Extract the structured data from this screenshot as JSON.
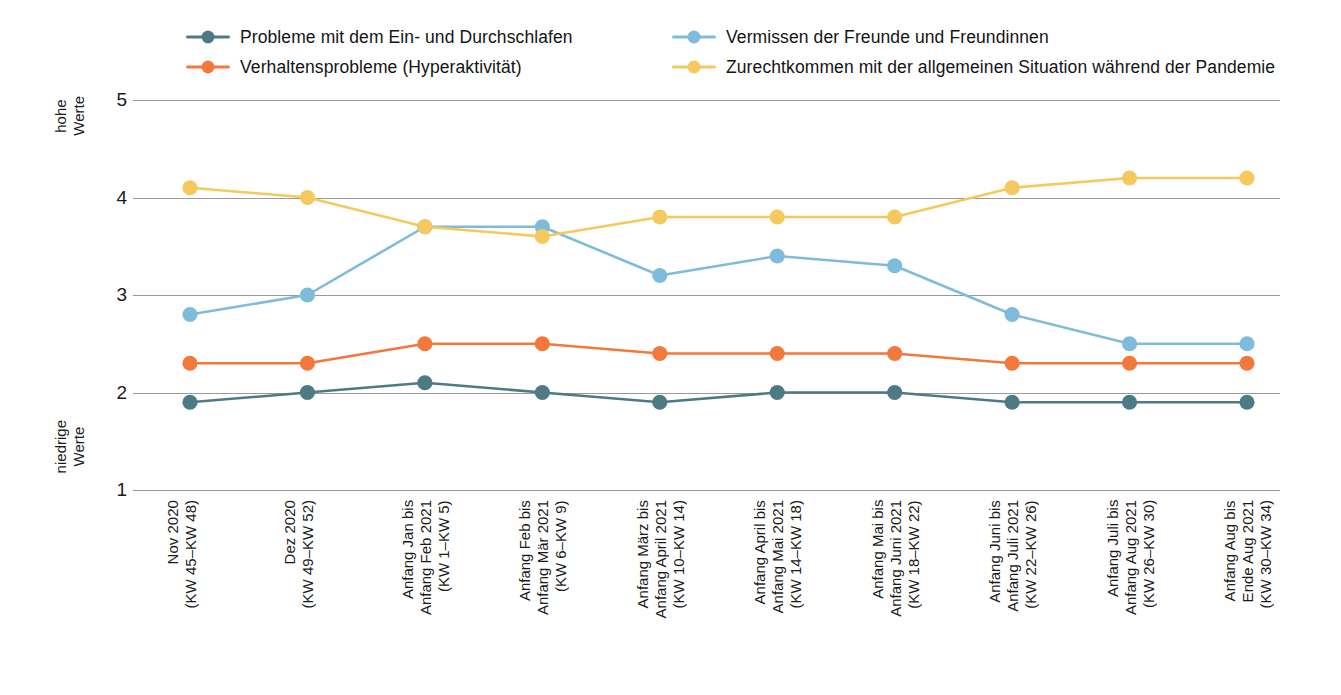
{
  "chart_data": {
    "type": "line",
    "title": "",
    "subtitle": "",
    "xlabel": "",
    "ylabel": "",
    "ylim": [
      1,
      5
    ],
    "yticks": [
      1,
      2,
      3,
      4,
      5
    ],
    "ytick_labels": [
      "1",
      "2",
      "3",
      "4",
      "5"
    ],
    "y_axis_high_note": "hohe\nWerte",
    "y_axis_low_note": "niedrige\nWerte",
    "grid": true,
    "legend_position": "top",
    "categories": [
      "Nov 2020\n(KW 45–KW 48)",
      "Dez 2020\n(KW 49–KW 52)",
      "Anfang Jan bis\nAnfang Feb 2021\n(KW 1–KW 5)",
      "Anfang Feb bis\nAnfang Mär 2021\n(KW 6–KW 9)",
      "Anfang März bis\nAnfang April 2021\n(KW 10–KW 14)",
      "Anfang April bis\nAnfang Mai 2021\n(KW 14–KW 18)",
      "Anfang Mai bis\nAnfang Juni 2021\n(KW 18–KW 22)",
      "Anfang Juni bis\nAnfang Juli 2021\n(KW 22–KW 26)",
      "Anfang Juli bis\nAnfang Aug 2021\n(KW 26–KW 30)",
      "Anfang Aug bis\nEnde Aug 2021\n(KW 30–KW 34)"
    ],
    "series": [
      {
        "name": "Probleme mit dem Ein- und Durchschlafen",
        "color": "#4d7b84",
        "values": [
          1.9,
          2.0,
          2.1,
          2.0,
          1.9,
          2.0,
          2.0,
          1.9,
          1.9,
          1.9
        ]
      },
      {
        "name": "Verhaltensprobleme (Hyperaktivität)",
        "color": "#f2783c",
        "values": [
          2.3,
          2.3,
          2.5,
          2.5,
          2.4,
          2.4,
          2.4,
          2.3,
          2.3,
          2.3
        ]
      },
      {
        "name": "Vermissen der Freunde und Freundinnen",
        "color": "#7fbcdb",
        "values": [
          2.8,
          3.0,
          3.7,
          3.7,
          3.2,
          3.4,
          3.3,
          2.8,
          2.5,
          2.5
        ]
      },
      {
        "name": "Zurechtkommen mit der allgemeinen Situation während der Pandemie",
        "color": "#f6c95f",
        "values": [
          4.1,
          4.0,
          3.7,
          3.6,
          3.8,
          3.8,
          3.8,
          4.1,
          4.2,
          4.2
        ]
      }
    ]
  },
  "legend": {
    "items": [
      {
        "label": "Probleme mit dem Ein- und Durchschlafen",
        "color": "#4d7b84"
      },
      {
        "label": "Vermissen der Freunde und Freundinnen",
        "color": "#7fbcdb"
      },
      {
        "label": "Verhaltensprobleme (Hyperaktivität)",
        "color": "#f2783c"
      },
      {
        "label": "Zurechtkommen mit der allgemeinen Situation während der Pandemie",
        "color": "#f6c95f"
      }
    ]
  }
}
